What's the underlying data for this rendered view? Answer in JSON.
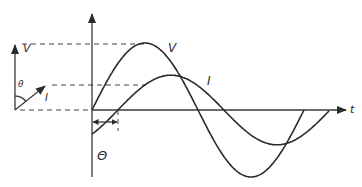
{
  "diagram": {
    "colors": {
      "line": "#2b2b2b",
      "background": "#ffffff"
    },
    "phasors": {
      "voltage_label": "V",
      "current_label": "I",
      "angle_label": "θ"
    },
    "waveforms": {
      "voltage": {
        "label": "V",
        "amplitude": 1.0,
        "phase_deg": 0,
        "cycles_shown": 1.0
      },
      "current": {
        "label": "I",
        "amplitude": 0.52,
        "phase_deg": -44,
        "cycles_shown": 1.0
      }
    },
    "axes": {
      "time_label": "t"
    },
    "phase_marker_label": "Θ"
  }
}
